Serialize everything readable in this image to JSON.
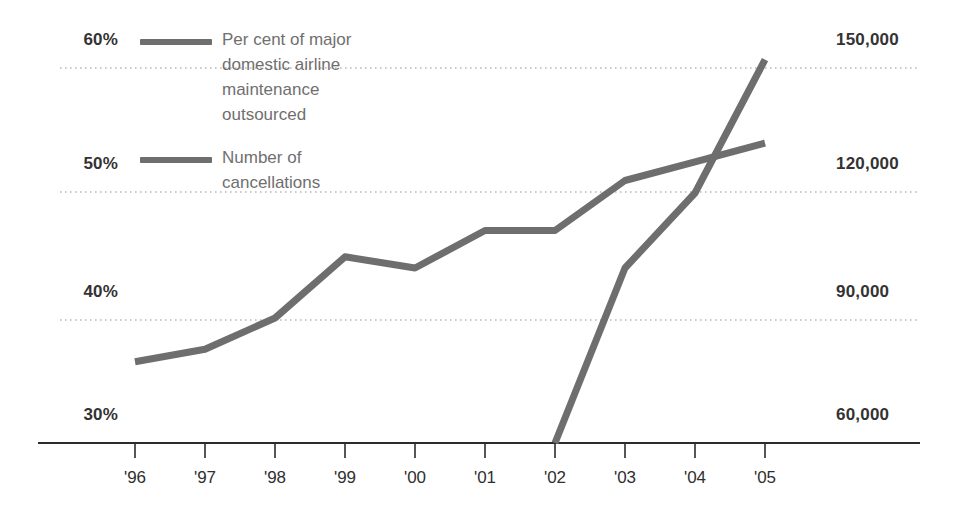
{
  "chart_data": {
    "type": "line",
    "title": "",
    "xlabel": "",
    "ylabel": "",
    "grid": true,
    "legend_position": "top-left-inside",
    "categories": [
      "'96",
      "'97",
      "'98",
      "'99",
      "'00",
      "'01",
      "'02",
      "'03",
      "'04",
      "'05"
    ],
    "axes": {
      "left": {
        "label": "Per cent of major domestic airline maintenance outsourced",
        "ticks": [
          "30%",
          "40%",
          "50%",
          "60%"
        ],
        "tick_values": [
          30,
          40,
          50,
          60
        ],
        "ylim": [
          30,
          60
        ]
      },
      "right": {
        "label": "Number of cancellations",
        "ticks": [
          "60,000",
          "90,000",
          "120,000",
          "150,000"
        ],
        "tick_values": [
          60000,
          90000,
          120000,
          150000
        ],
        "ylim": [
          60000,
          150000
        ]
      }
    },
    "series": [
      {
        "name": "Per cent of major domestic airline maintenance outsourced",
        "axis": "left",
        "unit": "%",
        "color": "#6e6e6e",
        "x": [
          "'96",
          "'97",
          "'98",
          "'99",
          "'00",
          "'01",
          "'02",
          "'03",
          "'04",
          "'05"
        ],
        "values": [
          36.5,
          37.5,
          40.0,
          44.9,
          44.0,
          47.0,
          47.0,
          51.0,
          52.5,
          54.0
        ]
      },
      {
        "name": "Number of cancellations",
        "axis": "right",
        "unit": "",
        "color": "#6e6e6e",
        "x": [
          "'02",
          "'03",
          "'04",
          "'05"
        ],
        "values": [
          60000,
          102000,
          120000,
          152000
        ]
      }
    ]
  },
  "legend": {
    "items": [
      {
        "label": "Per cent of major\ndomestic airline\nmaintenance\noutsourced",
        "color": "#6e6e6e"
      },
      {
        "label": "Number of\ncancellations",
        "color": "#6e6e6e"
      }
    ]
  },
  "left_axis_labels": [
    "60%",
    "50%",
    "40%",
    "30%"
  ],
  "right_axis_labels": [
    "150,000",
    "120,000",
    "90,000",
    "60,000"
  ],
  "x_axis_labels": [
    "'96",
    "'97",
    "'98",
    "'99",
    "'00",
    "'01",
    "'02",
    "'03",
    "'04",
    "'05"
  ],
  "colors": {
    "line": "#6e6e6e",
    "gridline": "#b9b9b9",
    "axis": "#2b2b2b",
    "label_text": "#333333",
    "legend_text": "#6f6f6f",
    "background": "#ffffff"
  }
}
